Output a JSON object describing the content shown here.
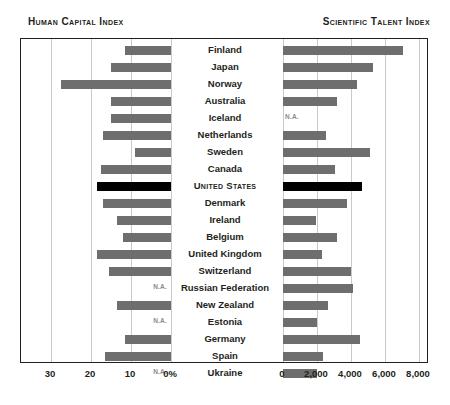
{
  "titles": {
    "left": "Human Capital Index",
    "right": "Scientific Talent Index"
  },
  "na_label": "N.A.",
  "axes": {
    "left_ticks": [
      "30",
      "20",
      "10",
      "0%"
    ],
    "right_ticks": [
      "0",
      "2,000",
      "4,000",
      "6,000",
      "8,000"
    ]
  },
  "colors": {
    "bar": "#6e6e6e",
    "highlight": "#000000",
    "frame": "#231f20",
    "grid": "#c9c9c9",
    "na_text": "#8a8a8a"
  },
  "chart_data": {
    "type": "bar",
    "orientation": "horizontal",
    "layout": "back-to-back butterfly (left series grows leftward, right series grows rightward)",
    "grid": true,
    "legend": "none",
    "categories": [
      "Finland",
      "Japan",
      "Norway",
      "Australia",
      "Iceland",
      "Netherlands",
      "Sweden",
      "Canada",
      "United States",
      "Denmark",
      "Ireland",
      "Belgium",
      "United Kingdom",
      "Switzerland",
      "Russian Federation",
      "New Zealand",
      "Estonia",
      "Germany",
      "Spain",
      "Ukraine"
    ],
    "highlight_category": "United States",
    "series": [
      {
        "name": "Human Capital Index",
        "side": "left",
        "xlabel": "Human Capital Index",
        "units": "percent",
        "xlim": [
          0,
          33
        ],
        "ticks": [
          30,
          20,
          10,
          0
        ],
        "tick_labels": [
          "30",
          "20",
          "10",
          "0%"
        ],
        "values": [
          11.5,
          15.0,
          27.5,
          15.0,
          15.0,
          17.0,
          9.0,
          17.5,
          18.5,
          17.0,
          13.5,
          12.0,
          18.5,
          15.5,
          null,
          13.5,
          null,
          11.5,
          16.5,
          null
        ],
        "missing_label": "N.A."
      },
      {
        "name": "Scientific Talent Index",
        "side": "right",
        "xlabel": "Scientific Talent Index",
        "units": "scientists and engineers per million people",
        "xlim": [
          0,
          8800
        ],
        "ticks": [
          0,
          2000,
          4000,
          6000,
          8000
        ],
        "tick_labels": [
          "0",
          "2,000",
          "4,000",
          "6,000",
          "8,000"
        ],
        "values": [
          7060,
          5300,
          4350,
          3200,
          null,
          2500,
          5100,
          3050,
          4650,
          3750,
          1950,
          3200,
          2300,
          4000,
          4100,
          2650,
          2000,
          4500,
          2350,
          2000
        ],
        "missing_label": "N.A."
      }
    ]
  },
  "rows": [
    {
      "country": "Finland",
      "emphasis": false,
      "left": 11.5,
      "right": 7060
    },
    {
      "country": "Japan",
      "emphasis": false,
      "left": 15.0,
      "right": 5300
    },
    {
      "country": "Norway",
      "emphasis": false,
      "left": 27.5,
      "right": 4350
    },
    {
      "country": "Australia",
      "emphasis": false,
      "left": 15.0,
      "right": 3200
    },
    {
      "country": "Iceland",
      "emphasis": false,
      "left": 15.0,
      "right": null
    },
    {
      "country": "Netherlands",
      "emphasis": false,
      "left": 17.0,
      "right": 2500
    },
    {
      "country": "Sweden",
      "emphasis": false,
      "left": 9.0,
      "right": 5100
    },
    {
      "country": "Canada",
      "emphasis": false,
      "left": 17.5,
      "right": 3050
    },
    {
      "country": "United States",
      "emphasis": true,
      "left": 18.5,
      "right": 4650
    },
    {
      "country": "Denmark",
      "emphasis": false,
      "left": 17.0,
      "right": 3750
    },
    {
      "country": "Ireland",
      "emphasis": false,
      "left": 13.5,
      "right": 1950
    },
    {
      "country": "Belgium",
      "emphasis": false,
      "left": 12.0,
      "right": 3200
    },
    {
      "country": "United Kingdom",
      "emphasis": false,
      "left": 18.5,
      "right": 2300
    },
    {
      "country": "Switzerland",
      "emphasis": false,
      "left": 15.5,
      "right": 4000
    },
    {
      "country": "Russian Federation",
      "emphasis": false,
      "left": null,
      "right": 4100
    },
    {
      "country": "New Zealand",
      "emphasis": false,
      "left": 13.5,
      "right": 2650
    },
    {
      "country": "Estonia",
      "emphasis": false,
      "left": null,
      "right": 2000
    },
    {
      "country": "Germany",
      "emphasis": false,
      "left": 11.5,
      "right": 4500
    },
    {
      "country": "Spain",
      "emphasis": false,
      "left": 16.5,
      "right": 2350
    },
    {
      "country": "Ukraine",
      "emphasis": false,
      "left": null,
      "right": 2000
    }
  ]
}
